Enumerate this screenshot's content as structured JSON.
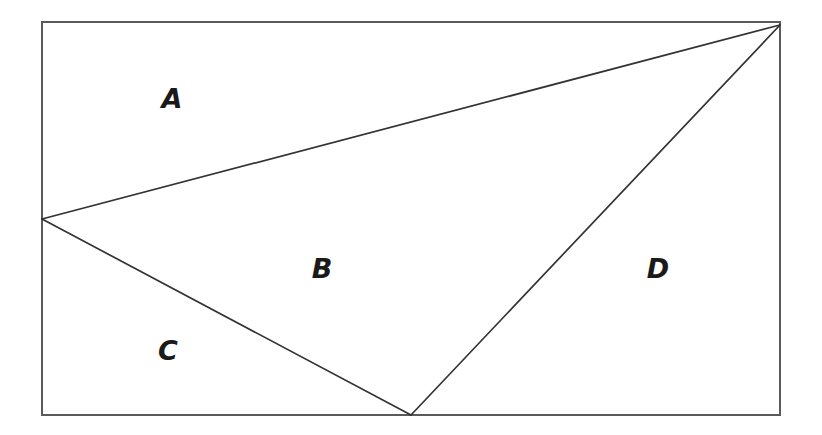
{
  "diagram": {
    "type": "partitioned-rectangle",
    "canvas": {
      "width": 822,
      "height": 435,
      "background": "#ffffff"
    },
    "frame": {
      "name": "outer-rectangle",
      "x": 42,
      "y": 22,
      "width": 738,
      "height": 393,
      "stroke": "#5a5a5a",
      "stroke_width": 1.6,
      "fill": "none",
      "corners": {
        "top_left": [
          42,
          22
        ],
        "top_right": [
          780,
          22
        ],
        "bottom_right": [
          780,
          415
        ],
        "bottom_left": [
          42,
          415
        ]
      }
    },
    "vertices": [
      {
        "id": "L",
        "label": "left-edge-vertex",
        "x": 42,
        "y": 219,
        "on": "left-edge"
      },
      {
        "id": "P",
        "label": "bottom-edge-vertex",
        "x": 411,
        "y": 415,
        "on": "bottom-edge"
      },
      {
        "id": "R",
        "label": "top-right-corner-vertex",
        "x": 780,
        "y": 25,
        "on": "top-right-corner"
      }
    ],
    "segments": [
      {
        "id": "seg-L-R",
        "name": "upper-diagonal",
        "from": [
          42,
          219
        ],
        "to": [
          780,
          25
        ],
        "stroke": "#333333",
        "stroke_width": 1.7
      },
      {
        "id": "seg-L-P",
        "name": "lower-left-diagonal",
        "from": [
          42,
          219
        ],
        "to": [
          411,
          415
        ],
        "stroke": "#333333",
        "stroke_width": 1.7
      },
      {
        "id": "seg-P-R",
        "name": "right-diagonal",
        "from": [
          411,
          415
        ],
        "to": [
          780,
          25
        ],
        "stroke": "#333333",
        "stroke_width": 1.7
      }
    ],
    "labels": [
      {
        "id": "A",
        "text": "A",
        "x": 172,
        "y": 98,
        "region": "top-left-region"
      },
      {
        "id": "B",
        "text": "B",
        "x": 322,
        "y": 268,
        "region": "central-region"
      },
      {
        "id": "C",
        "text": "C",
        "x": 168,
        "y": 350,
        "region": "lower-left-region"
      },
      {
        "id": "D",
        "text": "D",
        "x": 658,
        "y": 268,
        "region": "right-region"
      }
    ]
  }
}
